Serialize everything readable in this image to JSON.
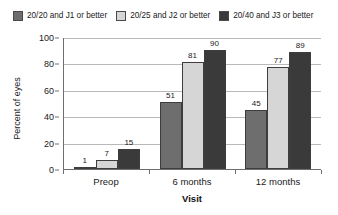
{
  "chart_data": {
    "type": "bar",
    "title": "",
    "xlabel": "Visit",
    "ylabel": "Percent of eyes",
    "categories": [
      "Preop",
      "6 months",
      "12 months"
    ],
    "series": [
      {
        "name": "20/20 and J1 or better",
        "color": "#6e6e6e",
        "values": [
          1,
          51,
          45
        ]
      },
      {
        "name": "20/25 and J2 or better",
        "color": "#d6d6d6",
        "values": [
          7,
          81,
          77
        ]
      },
      {
        "name": "20/40 and J3 or better",
        "color": "#3a3a3a",
        "values": [
          15,
          90,
          89
        ]
      }
    ],
    "ylim": [
      0,
      100
    ],
    "yticks": [
      0,
      20,
      40,
      60,
      80,
      100
    ],
    "ytick_labels": [
      "0",
      "20",
      "40",
      "60",
      "80",
      "100"
    ],
    "grid": true,
    "grid_axis": "y",
    "legend_position": "top-left",
    "data_labels": true
  },
  "legend": {
    "entries": [
      {
        "label": "20/20 and J1 or better",
        "swatch_name": "legend-swatch-series-1"
      },
      {
        "label": "20/25 and J2 or better",
        "swatch_name": "legend-swatch-series-2"
      },
      {
        "label": "20/40 and J3 or better",
        "swatch_name": "legend-swatch-series-3"
      }
    ]
  },
  "axes": {
    "y_title": "Percent of eyes",
    "x_title": "Visit"
  }
}
